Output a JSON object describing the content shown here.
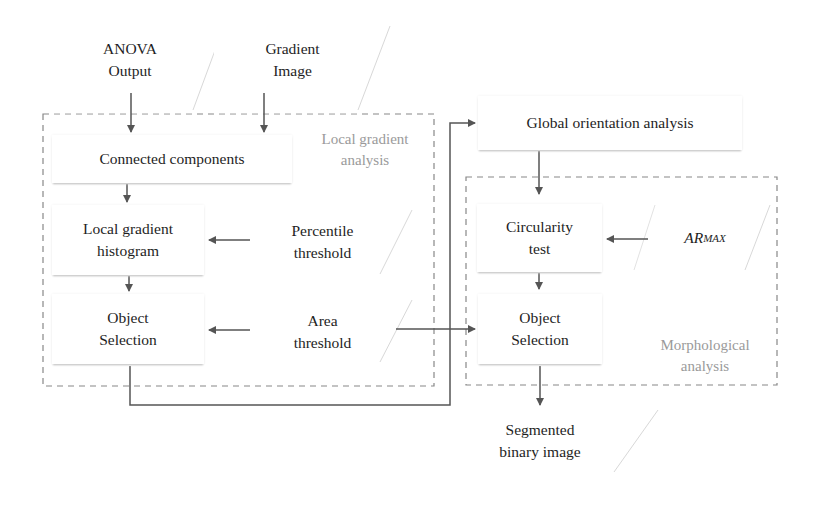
{
  "diagram": {
    "inputs": {
      "anova_output": "ANOVA\nOutput",
      "gradient_image": "Gradient\nImage",
      "percentile_threshold": "Percentile\nthreshold",
      "area_threshold": "Area\nthreshold",
      "ar_max_base": "AR",
      "ar_max_sub": "MAX"
    },
    "processes": {
      "connected_components": "Connected components",
      "local_gradient_histogram": "Local gradient\nhistogram",
      "object_selection_local": "Object\nSelection",
      "global_orientation_analysis": "Global orientation analysis",
      "circularity_test": "Circularity\ntest",
      "object_selection_morph": "Object\nSelection"
    },
    "outputs": {
      "segmented_binary_image": "Segmented\nbinary image"
    },
    "groups": {
      "local_gradient_analysis": "Local gradient\nanalysis",
      "morphological_analysis": "Morphological\nanalysis"
    },
    "colors": {
      "arrow": "#555555",
      "dashed_border": "#888888",
      "group_label": "#9a9a9a"
    }
  }
}
